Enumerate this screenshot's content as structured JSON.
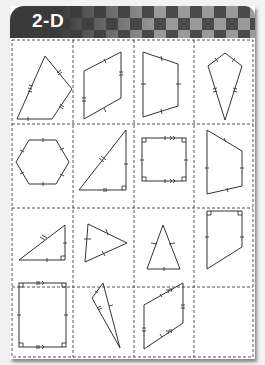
{
  "header": {
    "title": "2-D",
    "colors": {
      "dark": "#3a3a3a",
      "light": "#9a9a9a",
      "title": "#ffffff"
    }
  },
  "worksheet": {
    "grid": {
      "rows": 4,
      "columns": 4,
      "border_style": "dashed"
    },
    "cells": [
      {
        "row": 1,
        "col": 1,
        "shape": "irregular pentagon",
        "marks": "tick marks on sides"
      },
      {
        "row": 1,
        "col": 2,
        "shape": "parallelogram",
        "marks": "paired tick marks on opposite sides"
      },
      {
        "row": 1,
        "col": 3,
        "shape": "trapezoid",
        "marks": "tick marks on sides"
      },
      {
        "row": 1,
        "col": 4,
        "shape": "kite",
        "marks": "paired tick marks on adjacent sides"
      },
      {
        "row": 2,
        "col": 1,
        "shape": "regular hexagon",
        "marks": "tick marks on all sides"
      },
      {
        "row": 2,
        "col": 2,
        "shape": "right triangle",
        "marks": "right angle mark and tick marks"
      },
      {
        "row": 2,
        "col": 3,
        "shape": "square",
        "marks": "right angles, equal sides, parallel arrows"
      },
      {
        "row": 2,
        "col": 4,
        "shape": "right trapezoid",
        "marks": "tick marks on sides"
      },
      {
        "row": 3,
        "col": 1,
        "shape": "right triangle",
        "marks": "right angle mark and tick marks"
      },
      {
        "row": 3,
        "col": 2,
        "shape": "scalene triangle",
        "marks": "tick marks on sides"
      },
      {
        "row": 3,
        "col": 3,
        "shape": "isosceles triangle",
        "marks": "equal-side tick marks"
      },
      {
        "row": 3,
        "col": 4,
        "shape": "right trapezoid",
        "marks": "right angles and tick marks"
      },
      {
        "row": 4,
        "col": 1,
        "shape": "rectangle",
        "marks": "right angles, tick marks, parallel arrows"
      },
      {
        "row": 4,
        "col": 2,
        "shape": "obtuse triangle",
        "marks": "tick marks on sides"
      },
      {
        "row": 4,
        "col": 3,
        "shape": "parallelogram",
        "marks": "tick marks and parallel arrows"
      },
      {
        "row": 4,
        "col": 4,
        "shape": "empty",
        "marks": ""
      }
    ]
  }
}
